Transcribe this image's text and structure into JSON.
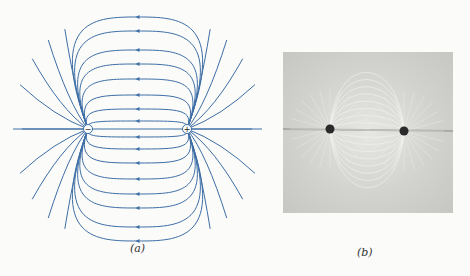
{
  "figure_a": {
    "caption": "(a)",
    "line_color": "#3d6ea6",
    "negative_charge": {
      "x": 88,
      "y": 129,
      "symbol": "−"
    },
    "positive_charge": {
      "x": 187,
      "y": 129,
      "symbol": "+"
    },
    "loop_heights": [
      8,
      20,
      34,
      50,
      65,
      79,
      98,
      112
    ],
    "outer_lines": [
      {
        "side": "left",
        "angles": [
          180,
          155,
          138,
          122,
          108,
          205,
          222,
          238,
          252
        ]
      },
      {
        "side": "right",
        "angles": [
          0,
          25,
          42,
          58,
          72,
          -25,
          -42,
          -58,
          -72
        ]
      }
    ]
  },
  "figure_b": {
    "caption": "(b)",
    "description": "photograph of grass seeds aligned in field of two charges",
    "dot_left": {
      "x": 47,
      "y": 77
    },
    "dot_right": {
      "x": 121,
      "y": 79
    }
  }
}
